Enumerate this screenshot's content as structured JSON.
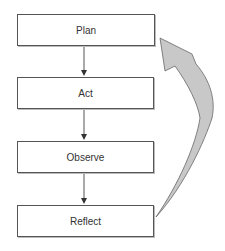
{
  "diagram": {
    "type": "cycle-flowchart",
    "steps": [
      {
        "label": "Plan"
      },
      {
        "label": "Act"
      },
      {
        "label": "Observe"
      },
      {
        "label": "Reflect"
      }
    ],
    "edges": [
      {
        "from": "Plan",
        "to": "Act",
        "style": "thin-arrow"
      },
      {
        "from": "Act",
        "to": "Observe",
        "style": "thin-arrow"
      },
      {
        "from": "Observe",
        "to": "Reflect",
        "style": "thin-arrow"
      },
      {
        "from": "Reflect",
        "to": "Plan",
        "style": "curved-block-arrow"
      }
    ],
    "colors": {
      "box_border": "#555555",
      "text": "#333333",
      "arrow_line": "#555555",
      "return_arrow_fill": "#c8c8c8",
      "return_arrow_stroke": "#666666"
    }
  }
}
